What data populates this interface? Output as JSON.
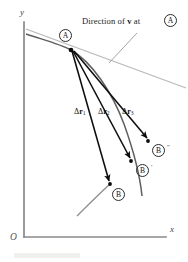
{
  "figure": {
    "type": "physics-trajectory-diagram",
    "background": "#ffffff",
    "width": 188,
    "height": 262
  },
  "axes": {
    "x_label": "x",
    "y_label": "y",
    "origin_label": "O",
    "color": "#7a7a7a",
    "x_axis": {
      "x1": 24,
      "y1": 237,
      "x2": 166,
      "y2": 237
    },
    "y_axis": {
      "x1": 24,
      "y1": 237,
      "x2": 24,
      "y2": 22
    },
    "x_label_pos": {
      "x": 170,
      "y": 230
    },
    "y_label_pos": {
      "x": 20,
      "y": 14
    },
    "origin_label_pos": {
      "x": 11,
      "y": 239
    }
  },
  "caption": {
    "text_before": "Direction of ",
    "vector_symbol": "v",
    "text_after": " at ",
    "point_label": "A",
    "full_text": "Direction of v at A",
    "pos": {
      "x": 82,
      "y": 22
    },
    "leader_line": {
      "x1": 137,
      "y1": 33,
      "x2": 109,
      "y2": 63
    }
  },
  "curve": {
    "name": "trajectory",
    "color": "#5a5a5a",
    "path": "M 26,34 C 44,40 60,44 71,50 C 92,62 112,92 124,124 C 134,152 140,176 142,196",
    "tail_path": "M 107,186 C 96,196 86,206 77,216"
  },
  "tangent": {
    "name": "velocity-direction-line",
    "color": "#b4b4b4",
    "line": {
      "x1": 26,
      "y1": 29,
      "x2": 186,
      "y2": 88
    }
  },
  "point_a": {
    "label": "A",
    "dot": {
      "x": 71,
      "y": 50
    },
    "badge_pos": {
      "x": 59,
      "y": 30
    }
  },
  "vectors": [
    {
      "name": "delta-r-1",
      "label_base": "Δ",
      "label_vec": "r",
      "label_sub": "1",
      "label_text": "Δr₁",
      "label_pos": {
        "x": 74,
        "y": 112
      },
      "from": {
        "x": 72,
        "y": 51
      },
      "to": {
        "x": 110,
        "y": 184
      },
      "target_point": "B"
    },
    {
      "name": "delta-r-2",
      "label_base": "Δ",
      "label_vec": "r",
      "label_sub": "2",
      "label_text": "Δr₂",
      "label_pos": {
        "x": 98,
        "y": 112
      },
      "from": {
        "x": 73,
        "y": 51
      },
      "to": {
        "x": 131,
        "y": 161
      },
      "target_point": "B'"
    },
    {
      "name": "delta-r-3",
      "label_base": "Δ",
      "label_vec": "r",
      "label_sub": "3",
      "label_text": "Δr₃",
      "label_pos": {
        "x": 122,
        "y": 112
      },
      "from": {
        "x": 74,
        "y": 51
      },
      "to": {
        "x": 148,
        "y": 141
      },
      "target_point": "B''"
    }
  ],
  "points_b": [
    {
      "name": "point-b-double-prime",
      "label": "B",
      "prime": "″",
      "dot": {
        "x": 148,
        "y": 141
      },
      "badge_pos": {
        "x": 152,
        "y": 148
      },
      "prime_pos": {
        "x": 167,
        "y": 147
      }
    },
    {
      "name": "point-b-prime",
      "label": "B",
      "prime": "′",
      "dot": {
        "x": 131,
        "y": 161
      },
      "badge_pos": {
        "x": 137,
        "y": 168
      },
      "prime_pos": {
        "x": 152,
        "y": 167
      }
    },
    {
      "name": "point-b",
      "label": "B",
      "prime": "",
      "dot": {
        "x": 110,
        "y": 184
      },
      "badge_pos": {
        "x": 113,
        "y": 191
      },
      "prime_pos": {
        "x": 128,
        "y": 190
      }
    }
  ]
}
